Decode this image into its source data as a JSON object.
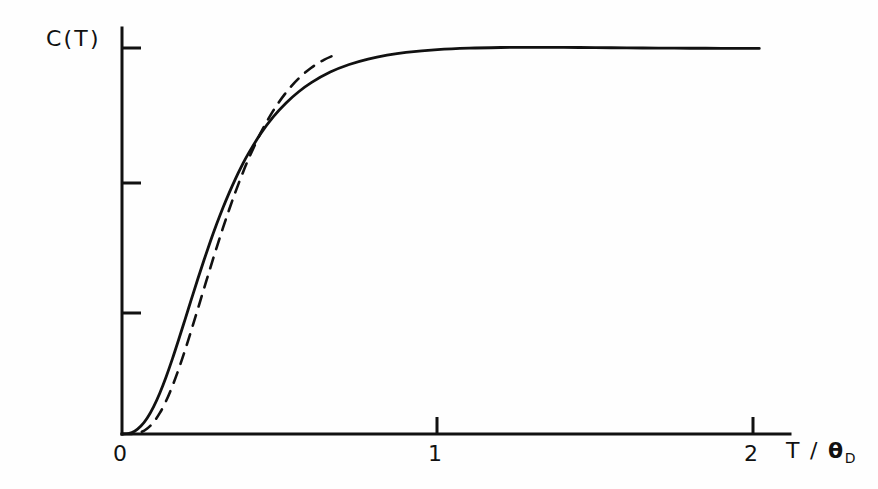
{
  "figure": {
    "background_color": "#fefefe",
    "ink_color": "#111111"
  },
  "axes": {
    "y_axis_title": "C(T)",
    "x_axis_title_numerator": "T",
    "x_axis_title_separator": " / ",
    "x_axis_title_symbol": "θ",
    "x_axis_title_subscript": "D",
    "x_tick_labels": [
      "0",
      "1",
      "2"
    ],
    "x_tick_values": [
      0,
      1,
      2
    ],
    "y_tick_labels": [
      "",
      "",
      ""
    ],
    "y_tick_count": 3
  },
  "chart_data": {
    "type": "line",
    "title": "",
    "subtitle": "",
    "xlabel": "T / θD",
    "ylabel": "C(T)",
    "xlim": [
      0,
      2.02
    ],
    "ylim": [
      0,
      1.06
    ],
    "grid": false,
    "legend": "none",
    "x_ticks": [
      0,
      1,
      2
    ],
    "x_tick_labels": [
      "0",
      "1",
      "2"
    ],
    "y_ticks": [
      0.33,
      0.66,
      1.0
    ],
    "y_tick_labels": [
      "",
      "",
      ""
    ],
    "annotations": [],
    "series": [
      {
        "name": "Debye",
        "style": "solid",
        "color": "#111111",
        "linewidth": 2.6,
        "x": [
          0.0,
          0.02,
          0.04,
          0.06,
          0.08,
          0.1,
          0.12,
          0.14,
          0.16,
          0.18,
          0.2,
          0.22,
          0.24,
          0.26,
          0.28,
          0.3,
          0.32,
          0.34,
          0.36,
          0.38,
          0.4,
          0.44,
          0.48,
          0.52,
          0.56,
          0.6,
          0.66,
          0.72,
          0.78,
          0.84,
          0.9,
          1.0,
          1.1,
          1.2,
          1.3,
          1.4,
          1.5,
          1.6,
          1.7,
          1.8,
          1.9,
          2.0,
          2.02
        ],
        "y": [
          0.0,
          0.0013,
          0.0072,
          0.0205,
          0.0415,
          0.0703,
          0.1063,
          0.1484,
          0.1952,
          0.2454,
          0.2971,
          0.3493,
          0.4009,
          0.4508,
          0.4987,
          0.5438,
          0.5861,
          0.6254,
          0.6617,
          0.6951,
          0.7257,
          0.7788,
          0.8222,
          0.8576,
          0.8866,
          0.9104,
          0.9377,
          0.9572,
          0.9712,
          0.9814,
          0.9886,
          0.9959,
          0.9997,
          1.0013,
          1.0017,
          1.0015,
          1.001,
          1.0003,
          0.9998,
          0.9994,
          0.9992,
          0.999,
          0.999
        ]
      },
      {
        "name": "Einstein",
        "style": "dashed",
        "color": "#111111",
        "linewidth": 2.6,
        "dash_pattern": "11 9",
        "x": [
          0.0,
          0.03,
          0.06,
          0.08,
          0.1,
          0.12,
          0.14,
          0.16,
          0.18,
          0.2,
          0.22,
          0.24,
          0.26,
          0.28,
          0.3,
          0.32,
          0.34,
          0.36,
          0.38,
          0.4,
          0.44,
          0.48,
          0.52,
          0.56,
          0.6,
          0.64,
          0.68
        ],
        "y": [
          0.0,
          0.0002,
          0.0048,
          0.0142,
          0.0305,
          0.0545,
          0.0861,
          0.1246,
          0.1689,
          0.2176,
          0.2694,
          0.3229,
          0.3769,
          0.4306,
          0.4831,
          0.5338,
          0.5822,
          0.6279,
          0.6707,
          0.7105,
          0.7806,
          0.8383,
          0.8847,
          0.9211,
          0.9489,
          0.9694,
          0.9838
        ]
      }
    ]
  }
}
